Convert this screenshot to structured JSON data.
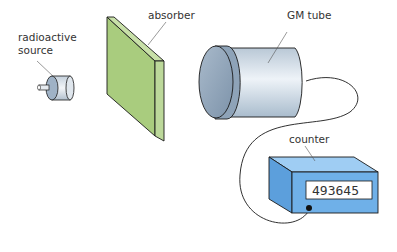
{
  "diagram": {
    "labels": {
      "source_line1": "radioactive",
      "source_line2": "source",
      "absorber": "absorber",
      "gm_tube": "GM tube",
      "counter": "counter"
    },
    "counter_display": "493645",
    "colors": {
      "absorber_face": "#a9cc7e",
      "absorber_edge": "#c8e0a8",
      "tube_body": "#c9d6e2",
      "tube_cap": "#8fa4ba",
      "counter_front": "#6fb0e8",
      "counter_top": "#9fcdf3",
      "counter_side": "#5c9fdc",
      "outline": "#1a1a1a"
    }
  }
}
